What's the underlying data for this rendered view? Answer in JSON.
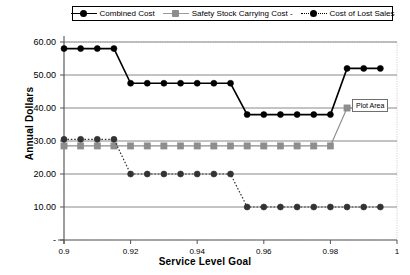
{
  "chart_data": {
    "type": "line",
    "title": "",
    "xlabel": "Service Level Goal",
    "ylabel": "Annual Dollars",
    "xlim": [
      0.9,
      1.0
    ],
    "ylim": [
      0,
      60
    ],
    "grid": true,
    "legend_position": "top",
    "x_ticks": [
      "0.9",
      "0.92",
      "0.94",
      "0.96",
      "0.98",
      "1"
    ],
    "x_tick_values": [
      0.9,
      0.92,
      0.94,
      0.96,
      0.98,
      1.0
    ],
    "y_ticks": [
      "-",
      "10.00",
      "20.00",
      "30.00",
      "40.00",
      "50.00",
      "60.00"
    ],
    "y_tick_values": [
      0,
      10,
      20,
      30,
      40,
      50,
      60
    ],
    "x": [
      0.9,
      0.905,
      0.91,
      0.915,
      0.92,
      0.925,
      0.93,
      0.935,
      0.94,
      0.945,
      0.95,
      0.955,
      0.96,
      0.965,
      0.97,
      0.975,
      0.98,
      0.985,
      0.99,
      0.995
    ],
    "series": [
      {
        "name": "Combined Cost",
        "color": "#000000",
        "marker": "diamond",
        "line_style": "solid",
        "values": [
          58.0,
          58.0,
          58.0,
          58.0,
          47.5,
          47.5,
          47.5,
          47.5,
          47.5,
          47.5,
          47.5,
          38.0,
          38.0,
          38.0,
          38.0,
          38.0,
          38.0,
          52.0,
          52.0,
          52.0
        ]
      },
      {
        "name": "Safety Stock Carrying Cost -",
        "color": "#8d8d8d",
        "marker": "square",
        "line_style": "solid",
        "values": [
          28.5,
          28.5,
          28.5,
          28.5,
          28.5,
          28.5,
          28.5,
          28.5,
          28.5,
          28.5,
          28.5,
          28.5,
          28.5,
          28.5,
          28.5,
          28.5,
          28.5,
          40.0,
          40.0,
          40.0
        ]
      },
      {
        "name": "Cost of Lost Sales",
        "color": "#333333",
        "marker": "circle",
        "line_style": "dotted",
        "values": [
          30.5,
          30.5,
          30.5,
          30.5,
          20.0,
          20.0,
          20.0,
          20.0,
          20.0,
          20.0,
          20.0,
          10.0,
          10.0,
          10.0,
          10.0,
          10.0,
          10.0,
          10.0,
          10.0,
          10.0
        ]
      }
    ],
    "annotations": [
      {
        "name": "plot-area-tooltip",
        "text": "Plot Area"
      }
    ]
  },
  "legend": {
    "items": [
      {
        "label": "Combined Cost",
        "marker": "diamond-marker-icon"
      },
      {
        "label": "Safety Stock Carrying Cost -",
        "marker": "square-marker-icon"
      },
      {
        "label": "Cost of Lost Sales",
        "marker": "circle-marker-icon"
      }
    ]
  },
  "axes": {
    "y_title": "Annual Dollars",
    "x_title": "Service Level Goal"
  },
  "tooltip": {
    "text": "Plot Area"
  }
}
